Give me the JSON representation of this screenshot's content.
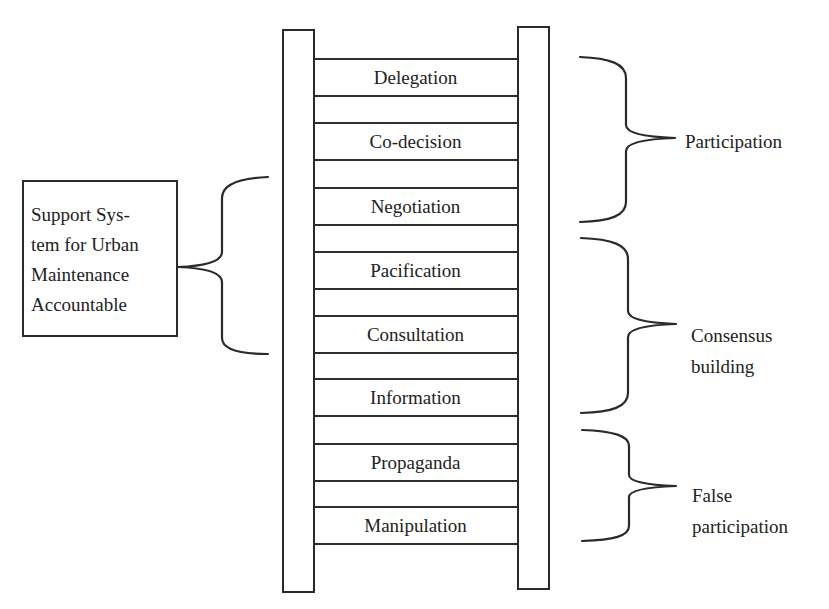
{
  "diagram": {
    "ladder": {
      "rungs": [
        {
          "label": "Delegation",
          "top": 58,
          "height": 38
        },
        {
          "label": "Co-decision",
          "top": 122,
          "height": 38
        },
        {
          "label": "Negotiation",
          "top": 187,
          "height": 38
        },
        {
          "label": "Pacification",
          "top": 251,
          "height": 38
        },
        {
          "label": "Consultation",
          "top": 315,
          "height": 38
        },
        {
          "label": "Information",
          "top": 378,
          "height": 38
        },
        {
          "label": "Propaganda",
          "top": 443,
          "height": 38
        },
        {
          "label": "Manipulation",
          "top": 506,
          "height": 38
        }
      ]
    },
    "side_box": {
      "lines": [
        "Support Sys-",
        "tem for Urban",
        "Maintenance",
        "Accountable"
      ]
    },
    "groups": [
      {
        "name": "participation",
        "lines": [
          "Participation"
        ],
        "covers": [
          "Delegation",
          "Co-decision",
          "Negotiation"
        ]
      },
      {
        "name": "consensus-building",
        "lines": [
          "Consensus",
          "building"
        ],
        "covers": [
          "Pacification",
          "Consultation",
          "Information"
        ]
      },
      {
        "name": "false-participation",
        "lines": [
          "False",
          "participation"
        ],
        "covers": [
          "Propaganda",
          "Manipulation"
        ]
      }
    ],
    "colors": {
      "stroke": "#2a2a2a",
      "text": "#222222",
      "background": "#ffffff"
    }
  }
}
